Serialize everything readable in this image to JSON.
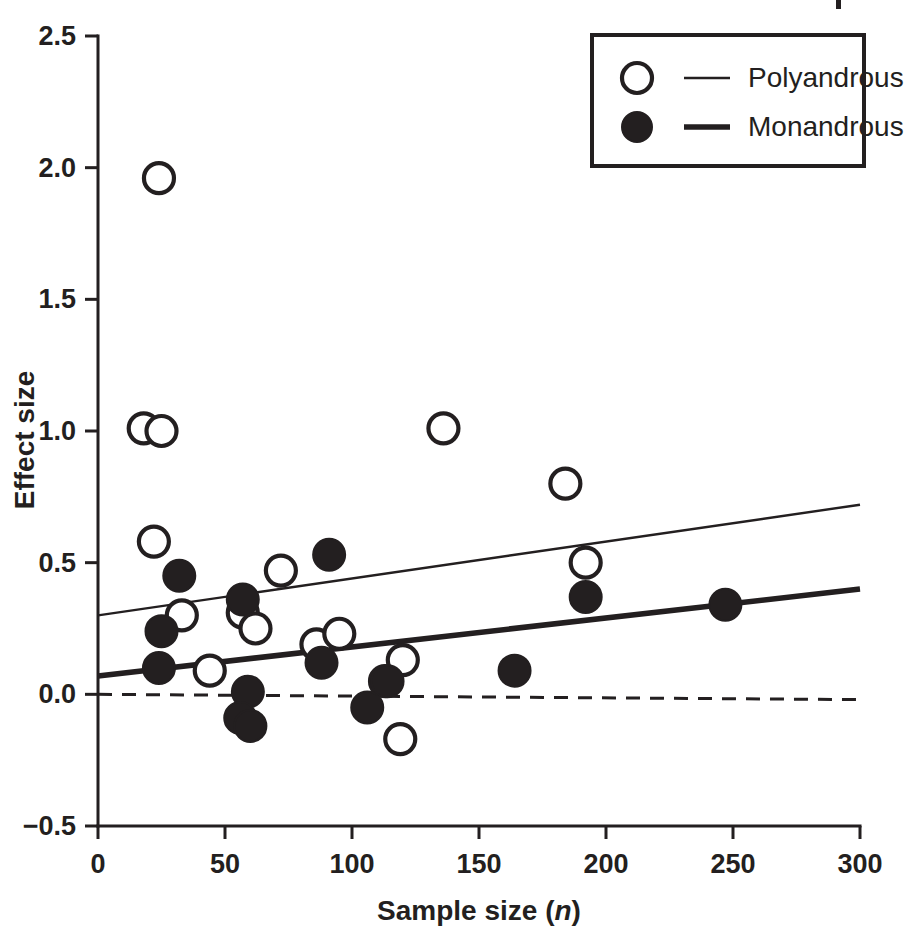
{
  "chart_data": {
    "type": "scatter",
    "title": "",
    "xlabel": "Sample size (n)",
    "xlabel_plain": "Sample size",
    "xlabel_italic": "n",
    "ylabel": "Effect size",
    "xlim": [
      0,
      300
    ],
    "ylim": [
      -0.5,
      2.5
    ],
    "xticks": [
      0,
      50,
      100,
      150,
      200,
      250,
      300
    ],
    "xticklabels": [
      "0",
      "50",
      "100",
      "150",
      "200",
      "250",
      "300"
    ],
    "yticks": [
      -0.5,
      0.0,
      0.5,
      1.0,
      1.5,
      2.0,
      2.5
    ],
    "yticklabels": [
      "−0.5",
      "0.0",
      "0.5",
      "1.0",
      "1.5",
      "2.0",
      "2.5"
    ],
    "grid": false,
    "legend_position": "top-right",
    "reference_lines": [
      {
        "name": "zero-line",
        "style": "dashed",
        "x": [
          0,
          300
        ],
        "y": [
          0.0,
          -0.02
        ]
      }
    ],
    "series": [
      {
        "name": "Polyandrous",
        "marker": "open-circle",
        "marker_color": "#ffffff",
        "marker_edge_color": "#231f20",
        "line_style": "thin-solid",
        "line_color": "#231f20",
        "fit_line": {
          "x": [
            0,
            300
          ],
          "y": [
            0.3,
            0.72
          ]
        },
        "points": [
          {
            "x": 18,
            "y": 1.01
          },
          {
            "x": 24,
            "y": 1.96
          },
          {
            "x": 25,
            "y": 1.0
          },
          {
            "x": 22,
            "y": 0.58
          },
          {
            "x": 33,
            "y": 0.3
          },
          {
            "x": 44,
            "y": 0.09
          },
          {
            "x": 57,
            "y": 0.31
          },
          {
            "x": 62,
            "y": 0.25
          },
          {
            "x": 72,
            "y": 0.47
          },
          {
            "x": 86,
            "y": 0.19
          },
          {
            "x": 95,
            "y": 0.23
          },
          {
            "x": 113,
            "y": 0.05
          },
          {
            "x": 120,
            "y": 0.13
          },
          {
            "x": 119,
            "y": -0.17
          },
          {
            "x": 136,
            "y": 1.01
          },
          {
            "x": 184,
            "y": 0.8
          },
          {
            "x": 192,
            "y": 0.5
          }
        ]
      },
      {
        "name": "Monandrous",
        "marker": "filled-circle",
        "marker_color": "#231f20",
        "marker_edge_color": "#231f20",
        "line_style": "thick-solid",
        "line_color": "#231f20",
        "fit_line": {
          "x": [
            0,
            300
          ],
          "y": [
            0.07,
            0.4
          ]
        },
        "points": [
          {
            "x": 25,
            "y": 0.24
          },
          {
            "x": 24,
            "y": 0.1
          },
          {
            "x": 32,
            "y": 0.45
          },
          {
            "x": 57,
            "y": 0.36
          },
          {
            "x": 59,
            "y": 0.01
          },
          {
            "x": 56,
            "y": -0.09
          },
          {
            "x": 60,
            "y": -0.12
          },
          {
            "x": 88,
            "y": 0.12
          },
          {
            "x": 91,
            "y": 0.53
          },
          {
            "x": 106,
            "y": -0.05
          },
          {
            "x": 114,
            "y": 0.05
          },
          {
            "x": 164,
            "y": 0.09
          },
          {
            "x": 192,
            "y": 0.37
          },
          {
            "x": 247,
            "y": 0.34
          }
        ]
      }
    ],
    "legend": {
      "entries": [
        {
          "label": "Polyandrous",
          "marker": "open-circle",
          "line": "thin-solid"
        },
        {
          "label": "Monandrous",
          "marker": "filled-circle",
          "line": "thick-solid"
        }
      ]
    },
    "colors": {
      "ink": "#231f20",
      "background": "#ffffff"
    }
  }
}
